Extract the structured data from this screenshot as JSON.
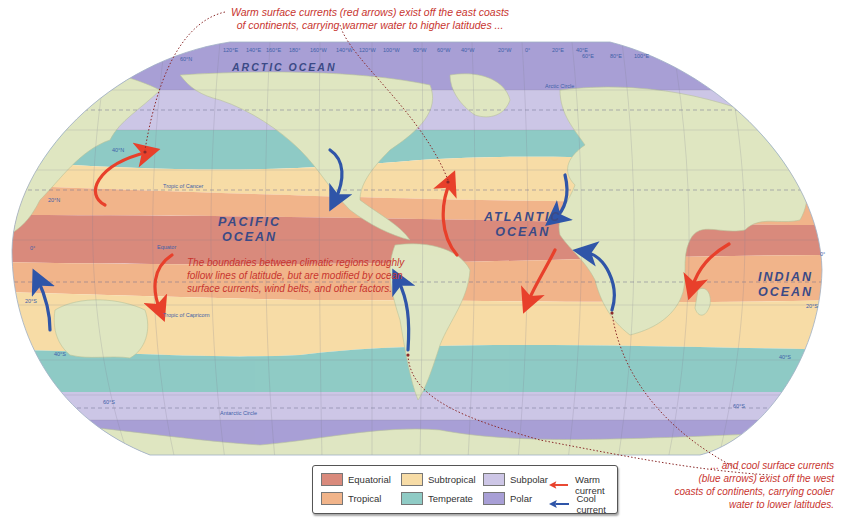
{
  "map": {
    "title": "World climatic regions of the ocean surface",
    "oceans": [
      {
        "id": "arctic",
        "label": "ARCTIC OCEAN"
      },
      {
        "id": "pacific",
        "label_line1": "PACIFIC",
        "label_line2": "OCEAN"
      },
      {
        "id": "atlantic",
        "label_line1": "ATLANTIC",
        "label_line2": "OCEAN"
      },
      {
        "id": "indian",
        "label_line1": "INDIAN",
        "label_line2": "OCEAN"
      }
    ],
    "reference_lines": {
      "arctic_circle": "Arctic Circle",
      "tropic_of_cancer": "Tropic of Cancer",
      "equator": "Equator",
      "tropic_of_capricorn": "Tropic of Capricorn",
      "antarctic_circle": "Antarctic Circle"
    },
    "latitude_labels": {
      "n60": "60°N",
      "n40": "40°N",
      "n20": "20°N",
      "zero_left": "0°",
      "zero_right": "0°",
      "s20_left": "20°S",
      "s20_right": "20°S",
      "s40_left": "40°S",
      "s40_right": "40°S",
      "s60_left": "60°S",
      "s60_right": "60°S"
    },
    "longitude_labels": [
      "120°E",
      "140°E",
      "160°E",
      "180°",
      "160°W",
      "140°W",
      "120°W",
      "100°W",
      "80°W",
      "60°W",
      "40°W",
      "20°W",
      "0°",
      "20°E",
      "40°E",
      "60°E",
      "80°E",
      "100°E"
    ]
  },
  "annotations": {
    "warm_line1": "Warm surface currents (red arrows) exist off the east coasts",
    "warm_line2": "of continents, carrying warmer water to higher latitudes ...",
    "boundaries_line1": "The boundaries between climatic regions roughly",
    "boundaries_line2": "follow lines of latitude, but are modified by ocean",
    "boundaries_line3": "surface currents, wind belts, and other factors.",
    "cool_line1": "... and cool surface currents",
    "cool_line2": "(blue arrows) exist off the west",
    "cool_line3": "coasts of continents,  carrying cooler",
    "cool_line4": "water to lower latitudes."
  },
  "legend": {
    "items": [
      {
        "label": "Equatorial",
        "color": "#d98a7c"
      },
      {
        "label": "Tropical",
        "color": "#f1b48a"
      },
      {
        "label": "Subtropical",
        "color": "#f7dca6"
      },
      {
        "label": "Temperate",
        "color": "#8fcbc5"
      },
      {
        "label": "Subpolar",
        "color": "#cdc6e6"
      },
      {
        "label": "Polar",
        "color": "#a89fd6"
      },
      {
        "label": "Warm current",
        "color": "#e8402b"
      },
      {
        "label": "Cool current",
        "color": "#2f55a8"
      }
    ]
  },
  "colors": {
    "land": "#dfe6c2",
    "equatorial": "#d98a7c",
    "tropical": "#f1b48a",
    "subtropical": "#f7dca6",
    "temperate": "#8fcbc5",
    "subpolar": "#cdc6e6",
    "polar": "#a89fd6",
    "warm_current": "#e8402b",
    "cool_current": "#2f55a8",
    "annotation_text": "#c8352f"
  }
}
